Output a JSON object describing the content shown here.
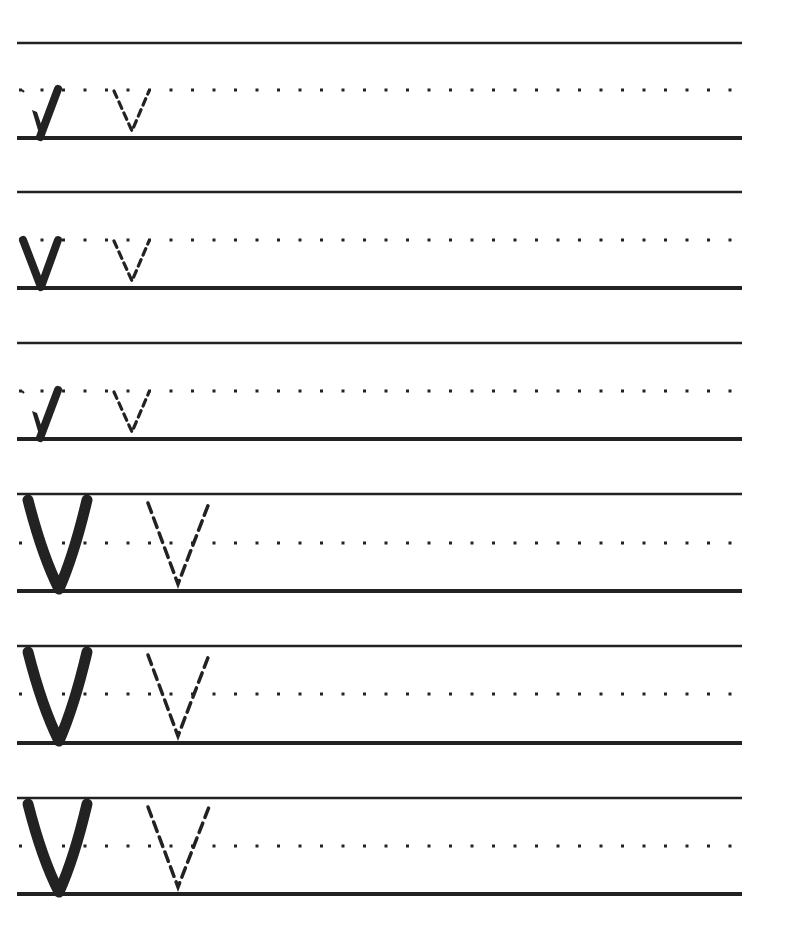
{
  "worksheet": {
    "subject": "Handwriting practice - letter V",
    "ink_color": "#222222",
    "line_left": 17,
    "line_right": 742,
    "rows": [
      {
        "case": "lower",
        "top": 43,
        "mid": 90,
        "bottom": 138
      },
      {
        "case": "lower",
        "top": 192,
        "mid": 240,
        "bottom": 288
      },
      {
        "case": "lower",
        "top": 343,
        "mid": 391,
        "bottom": 439
      },
      {
        "case": "upper",
        "top": 494,
        "mid": 543,
        "bottom": 591
      },
      {
        "case": "upper",
        "top": 646,
        "mid": 694,
        "bottom": 743
      },
      {
        "case": "upper",
        "top": 798,
        "mid": 846,
        "bottom": 894
      }
    ],
    "row_variants": [
      "arrow",
      "plain",
      "arrow",
      "plain",
      "plain",
      "plain"
    ]
  }
}
